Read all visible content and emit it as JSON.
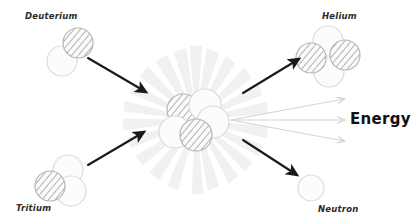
{
  "diagram": {
    "background_color": "#ffffff",
    "width": 416,
    "height": 224,
    "labels": {
      "deuterium": "Deuterium",
      "tritium": "Tritium",
      "helium": "Helium",
      "neutron": "Neutron",
      "energy": "Energy"
    },
    "colors": {
      "arrow_black": "#1a1a1a",
      "arrow_energy": "#d4d4d4",
      "burst_ray": "#f0f0f0",
      "particle_outline": "#cfcfcf",
      "particle_hatch": "#9a9a9a",
      "particle_plain_fill": "#fcfcfc",
      "label_text": "#2b2b2b"
    },
    "reactants": [
      {
        "name": "Deuterium",
        "nucleons": [
          {
            "type": "proton",
            "shading": "hatched",
            "cx": 78,
            "cy": 43,
            "r": 15
          },
          {
            "type": "neutron",
            "shading": "plain",
            "cx": 62,
            "cy": 61,
            "r": 15
          }
        ]
      },
      {
        "name": "Tritium",
        "nucleons": [
          {
            "type": "proton",
            "shading": "hatched",
            "cx": 50,
            "cy": 186,
            "r": 15
          },
          {
            "type": "neutron",
            "shading": "plain",
            "cx": 68,
            "cy": 170,
            "r": 15
          },
          {
            "type": "neutron",
            "shading": "plain",
            "cx": 71,
            "cy": 191,
            "r": 15
          }
        ]
      }
    ],
    "products": [
      {
        "name": "Helium",
        "nucleons": [
          {
            "type": "neutron",
            "shading": "plain",
            "cx": 328,
            "cy": 41,
            "r": 15
          },
          {
            "type": "proton",
            "shading": "hatched",
            "cx": 311,
            "cy": 58,
            "r": 15
          },
          {
            "type": "proton",
            "shading": "hatched",
            "cx": 345,
            "cy": 55,
            "r": 15
          },
          {
            "type": "neutron",
            "shading": "plain",
            "cx": 329,
            "cy": 72,
            "r": 15
          }
        ]
      },
      {
        "name": "Neutron",
        "nucleons": [
          {
            "type": "neutron",
            "shading": "plain",
            "cx": 311,
            "cy": 188,
            "r": 13
          }
        ]
      }
    ],
    "fusion_core": {
      "burst_center_x": 196,
      "burst_center_y": 120,
      "burst_ray_count": 22,
      "nucleons": [
        {
          "type": "proton",
          "shading": "hatched",
          "cx": 183,
          "cy": 110,
          "r": 16
        },
        {
          "type": "neutron",
          "shading": "plain",
          "cx": 205,
          "cy": 105,
          "r": 16
        },
        {
          "type": "neutron",
          "shading": "plain",
          "cx": 213,
          "cy": 122,
          "r": 16
        },
        {
          "type": "neutron",
          "shading": "plain",
          "cx": 175,
          "cy": 132,
          "r": 16
        },
        {
          "type": "proton",
          "shading": "hatched",
          "cx": 196,
          "cy": 135,
          "r": 16
        }
      ]
    },
    "arrows": [
      {
        "name": "deuterium-to-core",
        "style": "black",
        "x1": 88,
        "y1": 58,
        "x2": 147,
        "y2": 93
      },
      {
        "name": "tritium-to-core",
        "style": "black",
        "x1": 88,
        "y1": 165,
        "x2": 145,
        "y2": 131
      },
      {
        "name": "core-to-helium",
        "style": "black",
        "x1": 243,
        "y1": 93,
        "x2": 300,
        "y2": 58
      },
      {
        "name": "core-to-neutron",
        "style": "black",
        "x1": 243,
        "y1": 140,
        "x2": 298,
        "y2": 176
      },
      {
        "name": "energy-ray-upper",
        "style": "energy",
        "x1": 231,
        "y1": 120,
        "x2": 345,
        "y2": 99
      },
      {
        "name": "energy-ray-middle",
        "style": "energy",
        "x1": 231,
        "y1": 120,
        "x2": 345,
        "y2": 120
      },
      {
        "name": "energy-ray-lower",
        "style": "energy",
        "x1": 231,
        "y1": 120,
        "x2": 345,
        "y2": 141
      }
    ]
  }
}
